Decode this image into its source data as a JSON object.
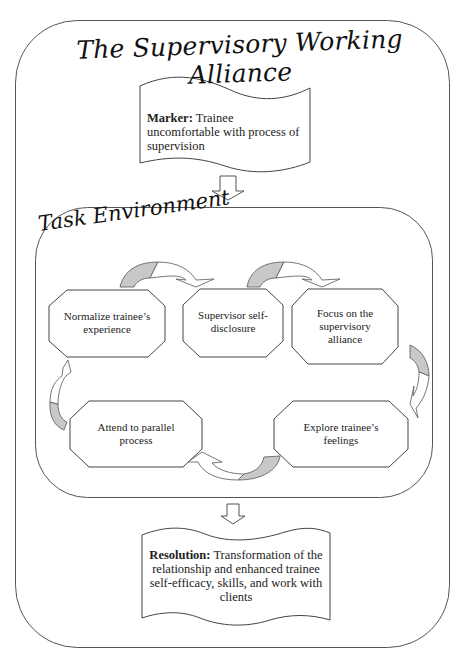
{
  "diagram": {
    "title": "The Supervisory Working Alliance",
    "marker": {
      "label": "Marker:",
      "text": " Trainee uncomfortable with process of supervision"
    },
    "task_environment": {
      "label": "Task Environment",
      "steps": [
        {
          "id": "normalize",
          "text": "Normalize trainee’s experience"
        },
        {
          "id": "disclosure",
          "text": "Supervisor self-disclosure"
        },
        {
          "id": "focus",
          "text": "Focus on the supervisory alliance"
        },
        {
          "id": "explore",
          "text": "Explore trainee’s feelings"
        },
        {
          "id": "attend",
          "text": "Attend to parallel process"
        }
      ],
      "cycle_order": [
        "normalize",
        "disclosure",
        "focus",
        "explore",
        "attend",
        "normalize"
      ]
    },
    "resolution": {
      "label": "Resolution:",
      "text": " Transformation of the relationship and enhanced trainee self-efficacy, skills, and work with clients"
    },
    "colors": {
      "stroke": "#555555",
      "arrow_fill": "#c8c8c8",
      "background": "#ffffff",
      "text": "#222222"
    }
  }
}
